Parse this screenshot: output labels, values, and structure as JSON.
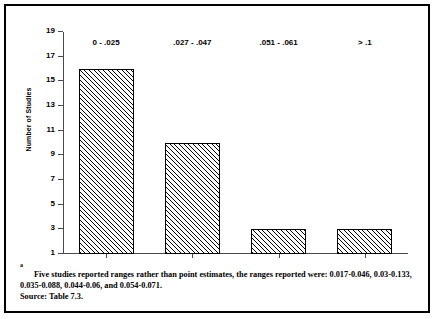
{
  "chart_data": {
    "type": "bar",
    "title": "",
    "xlabel": "",
    "ylabel": "Number of Studies",
    "categories": [
      "0 - .025",
      ".027 - .047",
      ".051 - .061",
      "> .1"
    ],
    "values": [
      16,
      10,
      3,
      3
    ],
    "ylim": [
      1,
      19
    ],
    "yticks": [
      1,
      3,
      5,
      7,
      9,
      11,
      13,
      15,
      17,
      19
    ],
    "ytick_labels": [
      "1",
      "3",
      "5",
      "7",
      "9",
      "11",
      "13",
      "15",
      "17",
      "19"
    ],
    "grid": false,
    "legend": false,
    "bar_fill": "diagonal-hatch",
    "bar_edge_color": "#000000",
    "axis_color": "#4a4a4a"
  },
  "footnote": {
    "marker": "a",
    "text": "Five studies reported ranges rather than point estimates, the ranges reported were: 0.017-0.046, 0.03-0.133, 0.035-0.088, 0.044-0.06, and 0.054-0.071.",
    "source": "Source: Table 7.3."
  }
}
